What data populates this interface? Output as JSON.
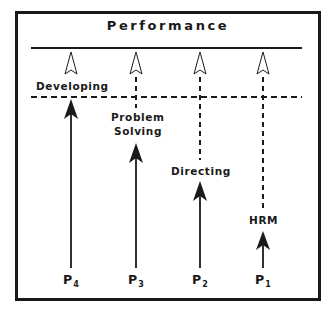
{
  "diagram": {
    "title": "Performance",
    "levels": [
      {
        "id": "P4",
        "base": "P",
        "sub": "4",
        "label_lines": [
          "Developing"
        ],
        "color": "#1a1a1a"
      },
      {
        "id": "P3",
        "base": "P",
        "sub": "3",
        "label_lines": [
          "Problem",
          "Solving"
        ],
        "color": "#1a1a1a"
      },
      {
        "id": "P2",
        "base": "P",
        "sub": "2",
        "label_lines": [
          "Directing"
        ],
        "color": "#1a1a1a"
      },
      {
        "id": "P1",
        "base": "P",
        "sub": "1",
        "label_lines": [
          "HRM"
        ],
        "color": "#1a1a1a"
      }
    ],
    "colors": {
      "ink": "#1a1a1a",
      "background": "#ffffff"
    }
  }
}
